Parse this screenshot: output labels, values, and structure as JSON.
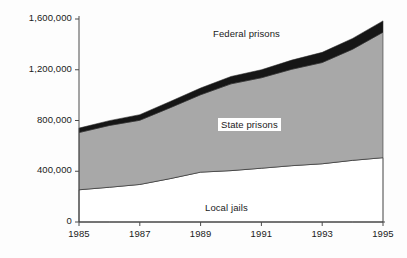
{
  "chart_data": {
    "type": "area",
    "stacked": true,
    "title": "",
    "subtitle": "",
    "xlabel": "",
    "ylabel": "No. in custody",
    "x": [
      1985,
      1986,
      1987,
      1988,
      1989,
      1990,
      1991,
      1992,
      1993,
      1994,
      1995
    ],
    "xlim": [
      1985,
      1995
    ],
    "ylim": [
      0,
      1600000
    ],
    "x_tick_labels": [
      "1985",
      "1987",
      "1989",
      "1991",
      "1993",
      "1995"
    ],
    "x_tick_values": [
      1985,
      1987,
      1989,
      1991,
      1993,
      1995
    ],
    "y_tick_labels": [
      "0",
      "400,000",
      "800,000",
      "1,200,000",
      "1,600,000"
    ],
    "y_tick_values": [
      0,
      400000,
      800000,
      1200000,
      1600000
    ],
    "grid": false,
    "legend_position": "in-plot-annotations",
    "series": [
      {
        "name": "Local jails",
        "color": "#ffffff",
        "values": [
          254000,
          274000,
          296000,
          342000,
          393000,
          405000,
          424000,
          444000,
          459000,
          486000,
          507000
        ]
      },
      {
        "name": "State prisons",
        "color": "#a8a8a8",
        "values": [
          451000,
          487000,
          506000,
          559000,
          610000,
          684000,
          713000,
          760000,
          798000,
          876000,
          989000
        ]
      },
      {
        "name": "Federal prisons",
        "color": "#161616",
        "values": [
          35000,
          38000,
          44000,
          49000,
          53000,
          58000,
          63000,
          72000,
          80000,
          85000,
          89000
        ]
      }
    ],
    "cumulative_totals": [
      740000,
      799000,
      846000,
      950000,
      1056000,
      1147000,
      1200000,
      1276000,
      1337000,
      1447000,
      1585000
    ],
    "annotations": [
      {
        "text": "Federal prisons",
        "boxed": false
      },
      {
        "text": "State prisons",
        "boxed": true
      },
      {
        "text": "Local jails",
        "boxed": false
      }
    ]
  },
  "axes": {
    "y_title": "No. in custody"
  },
  "colors": {
    "local_jails": "#ffffff",
    "state_prisons": "#a8a8a8",
    "federal_prisons": "#161616",
    "axis": "#4a4a4a",
    "text": "#1a1a1a",
    "background": "#fdfdfd"
  }
}
